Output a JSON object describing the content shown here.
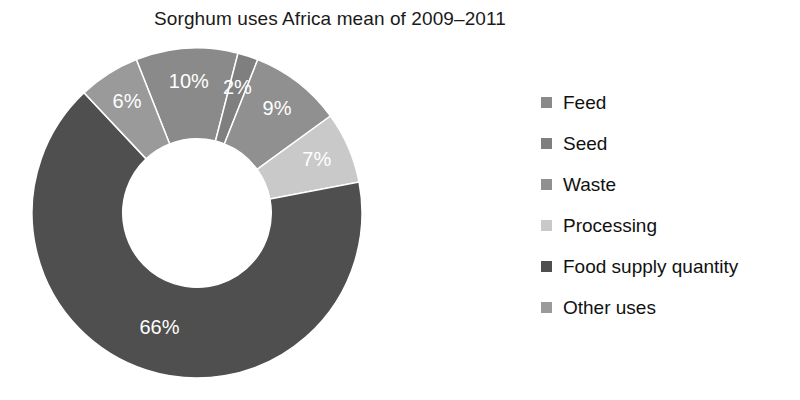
{
  "chart_data": {
    "type": "pie",
    "variant": "donut",
    "title": "Sorghum uses Africa mean of 2009–2011",
    "xlabel": "",
    "ylabel": "",
    "units": "percent",
    "legend_position": "right",
    "grid": false,
    "hole_ratio": 0.45,
    "start_angle_deg": -21.6,
    "direction": "clockwise",
    "categories": [
      "Feed",
      "Seed",
      "Waste",
      "Processing",
      "Food supply quantity",
      "Other uses"
    ],
    "values": [
      10,
      2,
      9,
      7,
      66,
      6
    ],
    "labels": [
      "10%",
      "2%",
      "9%",
      "7%",
      "66%",
      "6%"
    ],
    "colors": [
      "#8a8a8a",
      "#7f7f7f",
      "#909090",
      "#c9c9c9",
      "#4f4f4f",
      "#9a9a9a"
    ],
    "slices": [
      {
        "name": "Feed",
        "value": 10,
        "label": "10%",
        "color": "#8a8a8a"
      },
      {
        "name": "Seed",
        "value": 2,
        "label": "2%",
        "color": "#7f7f7f"
      },
      {
        "name": "Waste",
        "value": 9,
        "label": "9%",
        "color": "#909090"
      },
      {
        "name": "Processing",
        "value": 7,
        "label": "7%",
        "color": "#c9c9c9"
      },
      {
        "name": "Food supply quantity",
        "value": 66,
        "label": "66%",
        "color": "#4f4f4f"
      },
      {
        "name": "Other uses",
        "value": 6,
        "label": "6%",
        "color": "#9a9a9a"
      }
    ]
  },
  "legend": {
    "items": [
      {
        "label": "Feed",
        "color": "#8a8a8a"
      },
      {
        "label": "Seed",
        "color": "#7f7f7f"
      },
      {
        "label": "Waste",
        "color": "#909090"
      },
      {
        "label": "Processing",
        "color": "#c9c9c9"
      },
      {
        "label": "Food supply quantity",
        "color": "#4f4f4f"
      },
      {
        "label": "Other uses",
        "color": "#9a9a9a"
      }
    ]
  }
}
